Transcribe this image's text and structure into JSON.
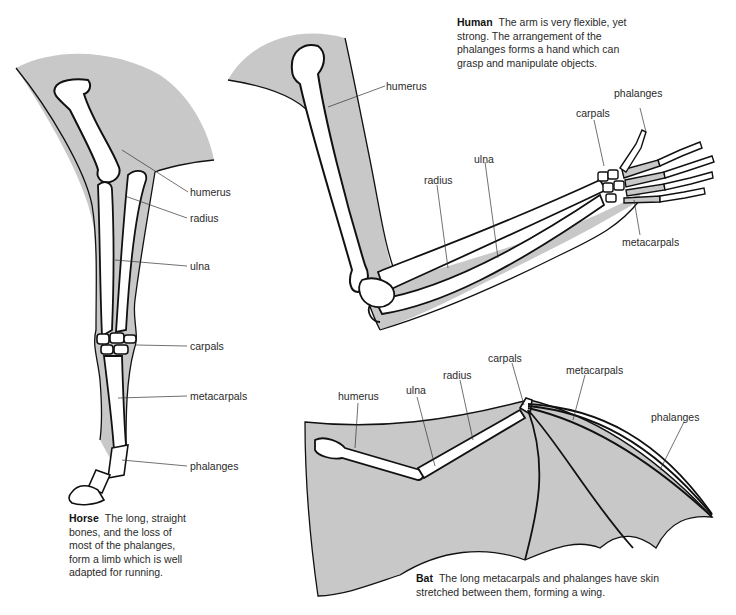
{
  "diagram": {
    "colors": {
      "skin": "#c8c8c8",
      "bone": "#ffffff",
      "outline": "#111111",
      "text": "#2a2a2a"
    },
    "horse": {
      "title": "Horse",
      "caption": "The long, straight bones, and the loss of most of the phalanges, form a limb which is well adapted for running.",
      "labels": {
        "humerus": "humerus",
        "radius": "radius",
        "ulna": "ulna",
        "carpals": "carpals",
        "metacarpals": "metacarpals",
        "phalanges": "phalanges"
      }
    },
    "human": {
      "title": "Human",
      "caption": "The arm is very flexible, yet strong. The arrangement of the phalanges forms a hand which can grasp and manipulate objects.",
      "labels": {
        "humerus": "humerus",
        "radius": "radius",
        "ulna": "ulna",
        "carpals": "carpals",
        "phalanges": "phalanges",
        "metacarpals": "metacarpals"
      }
    },
    "bat": {
      "title": "Bat",
      "caption": "The long metacarpals and phalanges have skin stretched between them, forming a wing.",
      "labels": {
        "humerus": "humerus",
        "ulna": "ulna",
        "radius": "radius",
        "carpals": "carpals",
        "metacarpals": "metacarpals",
        "phalanges": "phalanges"
      }
    }
  }
}
